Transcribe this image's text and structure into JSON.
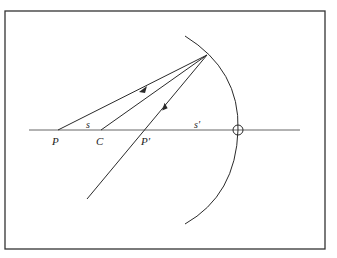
{
  "figure": {
    "type": "concave-mirror-ray-diagram",
    "frame": {
      "x": 5,
      "y": 11,
      "width": 320,
      "height": 238,
      "stroke": "#333333"
    },
    "optical_axis": {
      "y": 130,
      "x_start": 29,
      "x_end": 300
    },
    "mirror": {
      "vertex": {
        "x": 238,
        "y": 130
      },
      "top": {
        "x": 185,
        "y": 36
      },
      "bottom": {
        "x": 185,
        "y": 224
      }
    },
    "reflection_point": {
      "x": 207,
      "y": 55
    },
    "points": [
      {
        "id": "P",
        "label": "P",
        "x": 58,
        "label_x": 52,
        "label_y": 144
      },
      {
        "id": "C",
        "label": "C",
        "x": 101,
        "label_x": 96,
        "label_y": 144
      },
      {
        "id": "P_prime",
        "label": "P′",
        "x": 145,
        "label_x": 141,
        "label_y": 144
      }
    ],
    "distances": [
      {
        "id": "s",
        "label": "s",
        "x": 86,
        "y": 128
      },
      {
        "id": "s_prime",
        "label": "s′",
        "x": 194,
        "y": 128
      }
    ],
    "vertex_marker": {
      "symbol": "circle-cross",
      "x": 238,
      "y": 130,
      "r": 5
    },
    "rays": [
      {
        "id": "incident-ray",
        "from": "P",
        "to": "reflection_point",
        "arrow_at": 0.55,
        "direction": "toward-mirror"
      },
      {
        "id": "radial-ray",
        "from": "C",
        "to": "reflection_point"
      },
      {
        "id": "reflected-ray",
        "from": "reflection_point",
        "to_end": {
          "x": 87,
          "y": 199
        },
        "arrow_at": 0.3,
        "direction": "away-from-mirror"
      }
    ],
    "line_color": "#2a2a2a"
  }
}
